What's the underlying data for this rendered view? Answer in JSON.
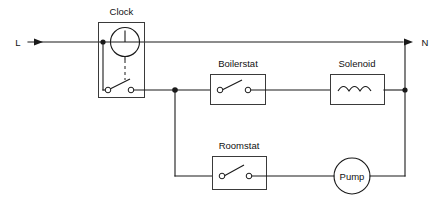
{
  "diagram": {
    "background_color": "#ffffff",
    "line_color": "#1a1a1a",
    "box_outline_color": "#3a3a3a"
  },
  "terminals": [
    {
      "id": "live",
      "label": "L",
      "name": "live-terminal"
    },
    {
      "id": "neutral",
      "label": "N",
      "name": "neutral-terminal"
    }
  ],
  "components": [
    {
      "id": "clock",
      "label": "Clock",
      "symbol": "clock-with-timed-switch",
      "state": "open"
    },
    {
      "id": "boilerstat",
      "label": "Boilerstat",
      "symbol": "switch",
      "state": "open"
    },
    {
      "id": "solenoid",
      "label": "Solenoid",
      "symbol": "coil",
      "state": "energised"
    },
    {
      "id": "roomstat",
      "label": "Roomstat",
      "symbol": "switch",
      "state": "open"
    },
    {
      "id": "pump",
      "label": "Pump",
      "symbol": "motor-circle",
      "state": "running"
    }
  ]
}
